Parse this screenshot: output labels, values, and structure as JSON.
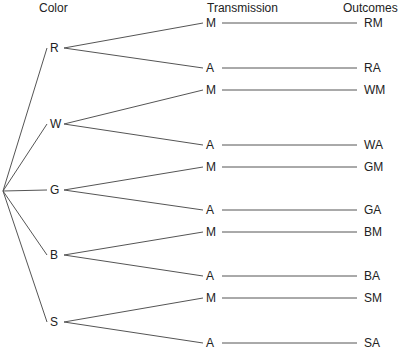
{
  "headers": {
    "color": "Color",
    "transmission": "Transmission",
    "outcomes": "Outcomes"
  },
  "style": {
    "line_color": "#555555",
    "text_color": "#222222",
    "background": "#ffffff"
  },
  "root": {
    "x": 3,
    "y": 191
  },
  "colors": [
    {
      "label": "R",
      "x": 55,
      "y": 48
    },
    {
      "label": "W",
      "x": 55,
      "y": 124
    },
    {
      "label": "G",
      "x": 55,
      "y": 190
    },
    {
      "label": "B",
      "x": 55,
      "y": 255
    },
    {
      "label": "S",
      "x": 55,
      "y": 322
    }
  ],
  "transmissions": [
    {
      "label": "M",
      "parent": 0,
      "y": 23,
      "outcome": "RM"
    },
    {
      "label": "A",
      "parent": 0,
      "y": 68,
      "outcome": "RA"
    },
    {
      "label": "M",
      "parent": 1,
      "y": 90,
      "outcome": "WM"
    },
    {
      "label": "A",
      "parent": 1,
      "y": 145,
      "outcome": "WA"
    },
    {
      "label": "M",
      "parent": 2,
      "y": 167,
      "outcome": "GM"
    },
    {
      "label": "A",
      "parent": 2,
      "y": 210,
      "outcome": "GA"
    },
    {
      "label": "M",
      "parent": 3,
      "y": 232,
      "outcome": "BM"
    },
    {
      "label": "A",
      "parent": 3,
      "y": 276,
      "outcome": "BA"
    },
    {
      "label": "M",
      "parent": 4,
      "y": 298,
      "outcome": "SM"
    },
    {
      "label": "A",
      "parent": 4,
      "y": 343,
      "outcome": "SA"
    }
  ],
  "layout": {
    "color_label_x": 50,
    "color_line_start_x": 64,
    "trans_label_x": 206,
    "trans_line_end_x": 203,
    "trans_line_start_x": 222,
    "outcome_line_end_x": 357,
    "outcome_label_x": 364
  }
}
